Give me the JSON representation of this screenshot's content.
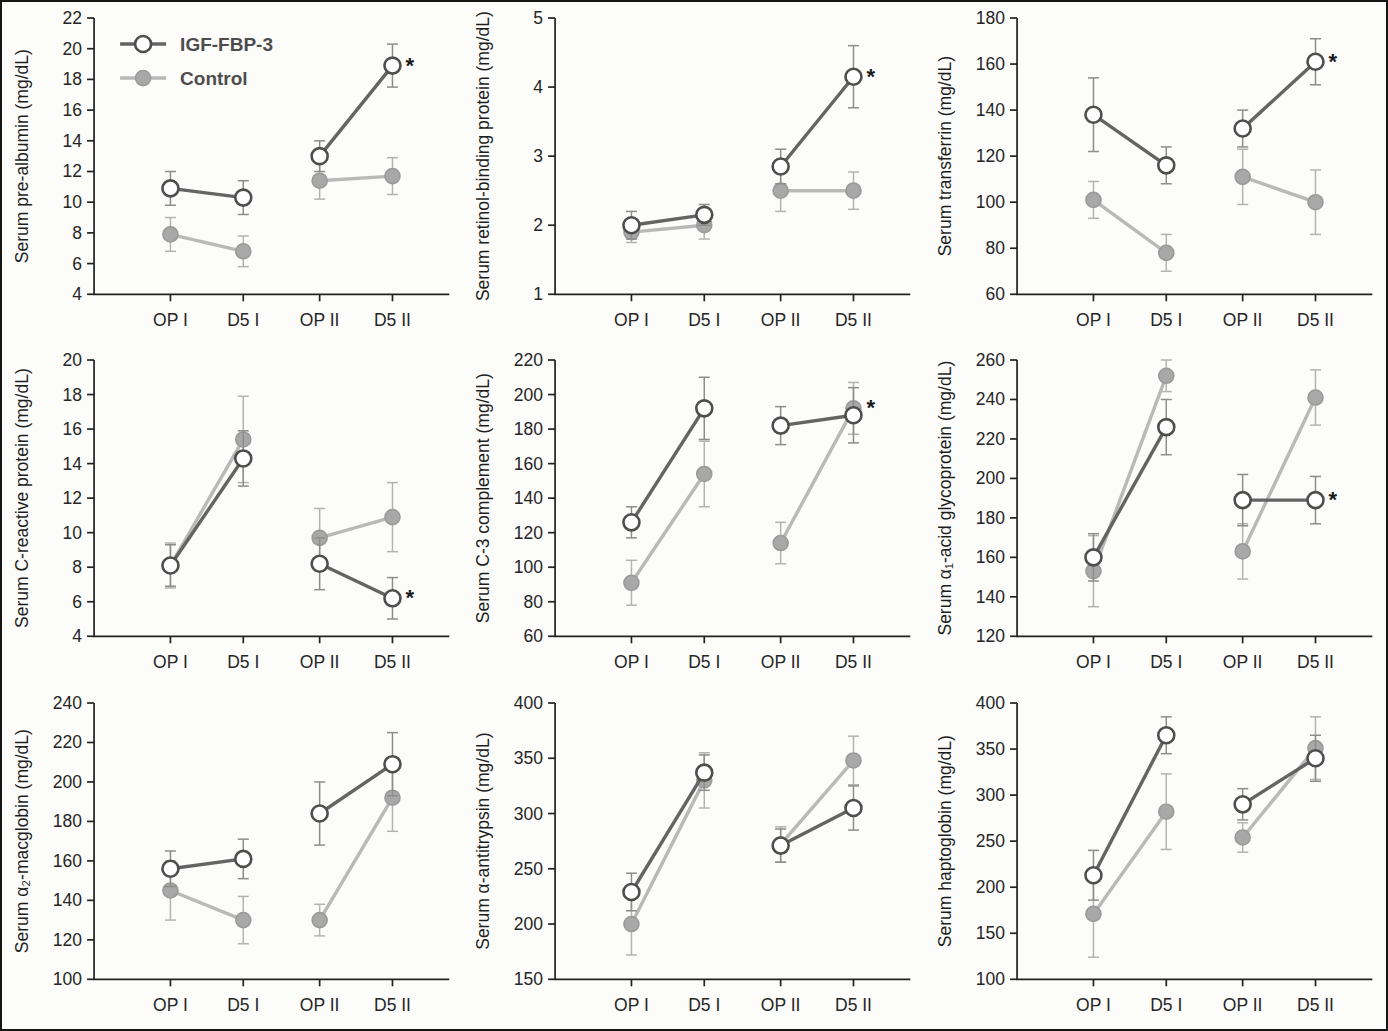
{
  "figure": {
    "background": "#fcfcfa",
    "border_color": "#161616",
    "categories": [
      "OP I",
      "D5 I",
      "OP II",
      "D5 II"
    ],
    "legend": {
      "position": "top-left-first-panel",
      "items": [
        {
          "label": "IGF-FBP-3",
          "series": "igf"
        },
        {
          "label": "Control",
          "series": "control"
        }
      ]
    },
    "colors": {
      "igf_line": "#646464",
      "igf_marker_fill": "#ffffff",
      "igf_marker_stroke": "#4e4e4e",
      "control_line": "#b9b9b9",
      "control_marker_fill": "#a8a8a8",
      "control_marker_stroke": "#9a9a9a",
      "error_igf": "#8d8d8d",
      "error_control": "#b3b3b3",
      "axis": "#222222",
      "tick_text": "#262626",
      "ylabel_text": "#1e1e1e",
      "legend_text": "#4d4d4d",
      "star": "#1a1a1a"
    }
  },
  "chart_data": [
    {
      "id": "pre-albumin",
      "type": "line",
      "ylabel": "Serum pre-albumin (mg/dL)",
      "ylim": [
        4,
        22
      ],
      "ytick_step": 2,
      "grid": false,
      "show_legend": true,
      "segments": [
        [
          0,
          1
        ],
        [
          2,
          3
        ]
      ],
      "series": [
        {
          "name": "IGF-FBP-3",
          "key": "igf",
          "values": [
            10.9,
            10.3,
            13.0,
            18.9
          ],
          "errors": [
            1.1,
            1.1,
            1.0,
            1.4
          ]
        },
        {
          "name": "Control",
          "key": "control",
          "values": [
            7.9,
            6.8,
            11.4,
            11.7
          ],
          "errors": [
            1.1,
            1.0,
            1.2,
            1.2
          ]
        }
      ],
      "significance": {
        "series": "igf",
        "index": 3,
        "symbol": "*"
      }
    },
    {
      "id": "retinol-binding-protein",
      "type": "line",
      "ylabel": "Serum retinol-binding protein (mg/dL)",
      "ylim": [
        1,
        5
      ],
      "ytick_step": 1,
      "grid": false,
      "show_legend": false,
      "segments": [
        [
          0,
          1
        ],
        [
          2,
          3
        ]
      ],
      "series": [
        {
          "name": "IGF-FBP-3",
          "key": "igf",
          "values": [
            2.0,
            2.15,
            2.85,
            4.15
          ],
          "errors": [
            0.2,
            0.15,
            0.25,
            0.45
          ]
        },
        {
          "name": "Control",
          "key": "control",
          "values": [
            1.9,
            2.0,
            2.5,
            2.5
          ],
          "errors": [
            0.15,
            0.2,
            0.3,
            0.27
          ]
        }
      ],
      "significance": {
        "series": "igf",
        "index": 3,
        "symbol": "*"
      }
    },
    {
      "id": "transferrin",
      "type": "line",
      "ylabel": "Serum transferrin (mg/dL)",
      "ylim": [
        60,
        180
      ],
      "ytick_step": 20,
      "grid": false,
      "show_legend": false,
      "segments": [
        [
          0,
          1
        ],
        [
          2,
          3
        ]
      ],
      "series": [
        {
          "name": "IGF-FBP-3",
          "key": "igf",
          "values": [
            138,
            116,
            132,
            161
          ],
          "errors": [
            16,
            8,
            8,
            10
          ]
        },
        {
          "name": "Control",
          "key": "control",
          "values": [
            101,
            78,
            111,
            100
          ],
          "errors": [
            8,
            8,
            12,
            14
          ]
        }
      ],
      "significance": {
        "series": "igf",
        "index": 3,
        "symbol": "*"
      }
    },
    {
      "id": "c-reactive-protein",
      "type": "line",
      "ylabel": "Serum C-reactive protein (mg/dL)",
      "ylim": [
        4,
        20
      ],
      "ytick_step": 2,
      "grid": false,
      "show_legend": false,
      "segments": [
        [
          0,
          1
        ],
        [
          2,
          3
        ]
      ],
      "series": [
        {
          "name": "IGF-FBP-3",
          "key": "igf",
          "values": [
            8.1,
            14.3,
            8.2,
            6.2
          ],
          "errors": [
            1.2,
            1.6,
            1.5,
            1.2
          ]
        },
        {
          "name": "Control",
          "key": "control",
          "values": [
            8.1,
            15.4,
            9.7,
            10.9
          ],
          "errors": [
            1.3,
            2.5,
            1.7,
            2.0
          ]
        }
      ],
      "significance": {
        "series": "igf",
        "index": 3,
        "symbol": "*"
      }
    },
    {
      "id": "c3-complement",
      "type": "line",
      "ylabel": "Serum C-3 complement (mg/dL)",
      "ylim": [
        60,
        220
      ],
      "ytick_step": 20,
      "grid": false,
      "show_legend": false,
      "segments": [
        [
          0,
          1
        ],
        [
          2,
          3
        ]
      ],
      "series": [
        {
          "name": "IGF-FBP-3",
          "key": "igf",
          "values": [
            126,
            192,
            182,
            188
          ],
          "errors": [
            9,
            18,
            11,
            16
          ]
        },
        {
          "name": "Control",
          "key": "control",
          "values": [
            91,
            154,
            114,
            192
          ],
          "errors": [
            13,
            19,
            12,
            15
          ]
        }
      ],
      "significance": {
        "series": "control",
        "index": 3,
        "symbol": "*"
      }
    },
    {
      "id": "alpha1-acid-glycoprotein",
      "type": "line",
      "ylabel": "Serum α₁-acid glycoprotein (mg/dL)",
      "ylim": [
        120,
        260
      ],
      "ytick_step": 20,
      "grid": false,
      "show_legend": false,
      "segments": [
        [
          0,
          1
        ],
        [
          2,
          3
        ]
      ],
      "series": [
        {
          "name": "IGF-FBP-3",
          "key": "igf",
          "values": [
            160,
            226,
            189,
            189
          ],
          "errors": [
            12,
            14,
            13,
            12
          ]
        },
        {
          "name": "Control",
          "key": "control",
          "values": [
            153,
            252,
            163,
            241
          ],
          "errors": [
            18,
            8,
            14,
            14
          ]
        }
      ],
      "significance": {
        "series": "igf",
        "index": 3,
        "symbol": "*"
      }
    },
    {
      "id": "alpha2-macglobin",
      "type": "line",
      "ylabel": "Serum α₂-macglobin (mg/dL)",
      "ylim": [
        100,
        240
      ],
      "ytick_step": 20,
      "grid": false,
      "show_legend": false,
      "segments": [
        [
          0,
          1
        ],
        [
          2,
          3
        ]
      ],
      "series": [
        {
          "name": "IGF-FBP-3",
          "key": "igf",
          "values": [
            156,
            161,
            184,
            209
          ],
          "errors": [
            9,
            10,
            16,
            16
          ]
        },
        {
          "name": "Control",
          "key": "control",
          "values": [
            145,
            130,
            130,
            192
          ],
          "errors": [
            15,
            12,
            8,
            17
          ]
        }
      ],
      "significance": null
    },
    {
      "id": "alpha-antitrypsin",
      "type": "line",
      "ylabel": "Serum α-antitrypsin (mg/dL)",
      "ylim": [
        150,
        400
      ],
      "ytick_step": 50,
      "grid": false,
      "show_legend": false,
      "segments": [
        [
          0,
          1
        ],
        [
          2,
          3
        ]
      ],
      "series": [
        {
          "name": "IGF-FBP-3",
          "key": "igf",
          "values": [
            229,
            337,
            271,
            305
          ],
          "errors": [
            17,
            16,
            15,
            20
          ]
        },
        {
          "name": "Control",
          "key": "control",
          "values": [
            200,
            330,
            272,
            348
          ],
          "errors": [
            28,
            25,
            16,
            22
          ]
        }
      ],
      "significance": null
    },
    {
      "id": "haptoglobin",
      "type": "line",
      "ylabel": "Serum haptoglobin (mg/dL)",
      "ylim": [
        100,
        400
      ],
      "ytick_step": 50,
      "grid": false,
      "show_legend": false,
      "segments": [
        [
          0,
          1
        ],
        [
          2,
          3
        ]
      ],
      "series": [
        {
          "name": "IGF-FBP-3",
          "key": "igf",
          "values": [
            213,
            365,
            290,
            340
          ],
          "errors": [
            27,
            20,
            17,
            25
          ]
        },
        {
          "name": "Control",
          "key": "control",
          "values": [
            171,
            282,
            254,
            351
          ],
          "errors": [
            47,
            41,
            16,
            34
          ]
        }
      ],
      "significance": null
    }
  ]
}
